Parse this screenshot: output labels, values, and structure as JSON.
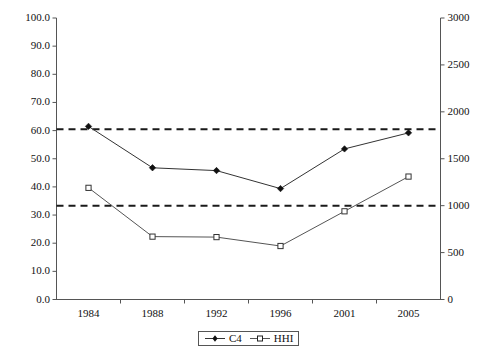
{
  "chart_data": {
    "type": "line",
    "title": "",
    "subtitle": "",
    "xlabel": "",
    "ylabel": "",
    "ylabel_right": "",
    "categories": [
      "1984",
      "1988",
      "1992",
      "1996",
      "2001",
      "2005"
    ],
    "grid": false,
    "legend_position": "bottom-center",
    "axes": {
      "left": {
        "ylim": [
          0.0,
          100.0
        ],
        "tick_step": 10.0,
        "ticks": [
          "0.0",
          "10.0",
          "20.0",
          "30.0",
          "40.0",
          "50.0",
          "60.0",
          "70.0",
          "80.0",
          "90.0",
          "100.0"
        ]
      },
      "right": {
        "ylim": [
          0,
          3000
        ],
        "tick_step": 500,
        "ticks": [
          "0",
          "500",
          "1000",
          "1500",
          "2000",
          "2500",
          "3000"
        ]
      }
    },
    "series": [
      {
        "name": "C4",
        "axis": "left",
        "marker": "filled-diamond",
        "color": "#333333",
        "values": [
          61.5,
          46.8,
          45.8,
          39.4,
          53.5,
          59.2
        ]
      },
      {
        "name": "HHI",
        "axis": "right",
        "marker": "open-square",
        "color": "#555555",
        "values": [
          1190,
          670,
          665,
          570,
          940,
          1310
        ]
      }
    ],
    "reference_lines": [
      {
        "name": "c4-threshold",
        "axis": "left",
        "value": 60.5,
        "style": "dashed",
        "color": "#1a1a1a"
      },
      {
        "name": "hhi-threshold",
        "axis": "right",
        "value": 1000,
        "style": "dashed",
        "color": "#1a1a1a"
      }
    ],
    "legend": [
      {
        "label": "C4",
        "marker": "filled-diamond"
      },
      {
        "label": "HHI",
        "marker": "open-square"
      }
    ]
  }
}
